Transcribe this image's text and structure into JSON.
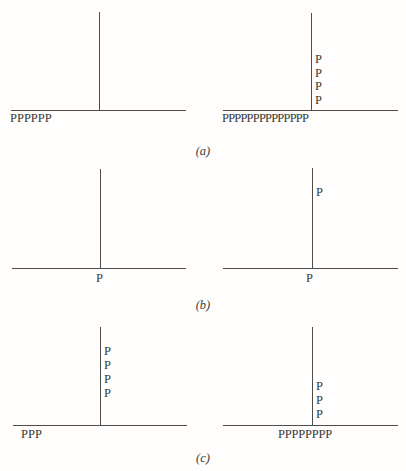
{
  "figure": {
    "colors": {
      "background": "#fffefc",
      "line": "#4d4d4d",
      "text": "#3a3a3a"
    },
    "caption_labels": {
      "a": "(a)",
      "b": "(b)",
      "c": "(c)"
    },
    "rows": {
      "a": {
        "left": {
          "baseline_label": "PPPPPP"
        },
        "right": {
          "axis_stack": [
            "P",
            "P",
            "P",
            "P"
          ],
          "baseline_label": "PPPPPPPPPPPPPP"
        }
      },
      "b": {
        "left": {
          "origin_label": "P"
        },
        "right": {
          "axis_stack": [
            "P"
          ],
          "origin_label": "P"
        }
      },
      "c": {
        "left": {
          "axis_stack": [
            "P",
            "P",
            "P",
            "P"
          ],
          "baseline_label": "PPP"
        },
        "right": {
          "axis_stack": [
            "P",
            "P",
            "P"
          ],
          "baseline_label": "PPPPPPPP"
        }
      }
    }
  }
}
